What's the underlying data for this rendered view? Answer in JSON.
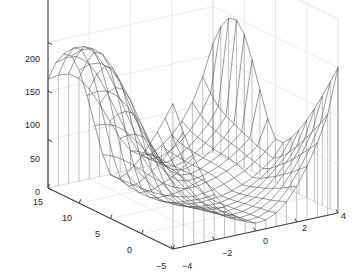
{
  "figure": {
    "type": "matlab-3d-mesh-figure",
    "background_color": "#ffffff",
    "axis_line_color": "#404040",
    "grid_color": "#e6e6e6",
    "mesh_line_color": "#4d4d4d",
    "skirt_line_color": "#808080",
    "tick_label_color": "#262626"
  },
  "axes": {
    "z": {
      "label": "",
      "min": 0,
      "max": 200,
      "ticks": [
        {
          "value": 0,
          "text": "0",
          "x": 40,
          "y": 188
        },
        {
          "value": 50,
          "text": "50",
          "x": 40,
          "y": 155
        },
        {
          "value": 100,
          "text": "100",
          "x": 40,
          "y": 121
        },
        {
          "value": 150,
          "text": "150",
          "x": 40,
          "y": 88
        },
        {
          "value": 200,
          "text": "200",
          "x": 40,
          "y": 55
        }
      ]
    },
    "y": {
      "label": "",
      "min": -5,
      "max": 15,
      "ticks": [
        {
          "value": 15,
          "text": "15",
          "x": 33,
          "y": 198
        },
        {
          "value": 10,
          "text": "10",
          "x": 62,
          "y": 214
        },
        {
          "value": 5,
          "text": "5",
          "x": 95,
          "y": 230
        },
        {
          "value": 0,
          "text": "0",
          "x": 127,
          "y": 246
        },
        {
          "value": -5,
          "text": "−5",
          "x": 156,
          "y": 262
        }
      ]
    },
    "x": {
      "label": "",
      "min": -4,
      "max": 4,
      "ticks": [
        {
          "value": -4,
          "text": "−4",
          "x": 182,
          "y": 262
        },
        {
          "value": -2,
          "text": "−2",
          "x": 222,
          "y": 249
        },
        {
          "value": 0,
          "text": "0",
          "x": 263,
          "y": 237
        },
        {
          "value": 2,
          "text": "2",
          "x": 302,
          "y": 224
        },
        {
          "value": 4,
          "text": "4",
          "x": 341,
          "y": 212
        }
      ]
    }
  },
  "chart_data": {
    "type": "surface",
    "title": "",
    "xlabel": "",
    "ylabel": "",
    "zlabel": "",
    "xlim": [
      -4,
      4
    ],
    "ylim": [
      -5,
      15
    ],
    "zlim": [
      0,
      200
    ],
    "xticks": [
      -4,
      -2,
      0,
      2,
      4
    ],
    "yticks": [
      -5,
      0,
      5,
      10,
      15
    ],
    "zticks": [
      0,
      50,
      100,
      150,
      200
    ],
    "grid": true,
    "legend": null,
    "view_azimuth": -37.5,
    "view_elevation": 30,
    "mesh_style": "wireframe-with-skirt",
    "nx": 17,
    "ny": 17,
    "x": [
      -4,
      -3.5,
      -3,
      -2.5,
      -2,
      -1.5,
      -1,
      -0.5,
      0,
      0.5,
      1,
      1.5,
      2,
      2.5,
      3,
      3.5,
      4
    ],
    "y": [
      -5,
      -3.75,
      -2.5,
      -1.25,
      0,
      1.25,
      2.5,
      3.75,
      5,
      6.25,
      7.5,
      8.75,
      10,
      11.25,
      12.5,
      13.75,
      15
    ],
    "z_rows": [
      [
        150,
        118,
        90,
        66,
        47,
        31,
        20,
        12,
        8,
        9,
        14,
        23,
        37,
        55,
        77,
        104,
        150
      ],
      [
        131,
        102,
        78,
        57,
        40,
        27,
        17,
        10,
        7,
        8,
        12,
        20,
        32,
        48,
        67,
        90,
        131
      ],
      [
        113,
        88,
        67,
        49,
        34,
        23,
        14,
        8,
        6,
        7,
        11,
        17,
        27,
        41,
        58,
        78,
        113
      ],
      [
        96,
        74,
        56,
        41,
        29,
        19,
        12,
        7,
        5,
        6,
        9,
        15,
        23,
        35,
        49,
        66,
        96
      ],
      [
        80,
        62,
        47,
        34,
        24,
        16,
        10,
        6,
        4,
        5,
        8,
        12,
        19,
        29,
        41,
        55,
        80
      ],
      [
        66,
        51,
        38,
        28,
        19,
        13,
        8,
        5,
        3,
        4,
        6,
        10,
        16,
        24,
        34,
        45,
        66
      ],
      [
        54,
        41,
        31,
        22,
        15,
        10,
        6,
        4,
        3,
        3,
        5,
        8,
        13,
        19,
        27,
        37,
        54
      ],
      [
        45,
        35,
        26,
        19,
        13,
        9,
        5,
        3,
        2,
        3,
        4,
        7,
        11,
        16,
        23,
        31,
        45
      ],
      [
        45,
        38,
        31,
        24,
        18,
        13,
        9,
        6,
        4,
        5,
        7,
        10,
        14,
        19,
        26,
        34,
        45
      ],
      [
        62,
        58,
        52,
        44,
        35,
        26,
        18,
        12,
        8,
        8,
        10,
        13,
        17,
        22,
        28,
        36,
        62
      ],
      [
        88,
        87,
        83,
        75,
        63,
        49,
        35,
        22,
        13,
        10,
        11,
        14,
        18,
        24,
        31,
        40,
        88
      ],
      [
        115,
        117,
        115,
        107,
        93,
        74,
        53,
        34,
        19,
        12,
        11,
        14,
        19,
        25,
        33,
        43,
        115
      ],
      [
        137,
        141,
        140,
        132,
        116,
        94,
        68,
        44,
        24,
        14,
        11,
        14,
        19,
        26,
        35,
        47,
        137
      ],
      [
        148,
        152,
        151,
        143,
        126,
        102,
        75,
        48,
        26,
        14,
        11,
        14,
        20,
        28,
        38,
        51,
        148
      ],
      [
        146,
        150,
        149,
        141,
        124,
        100,
        73,
        47,
        25,
        14,
        11,
        15,
        21,
        30,
        41,
        57,
        146
      ],
      [
        133,
        136,
        135,
        127,
        112,
        90,
        66,
        42,
        23,
        13,
        12,
        16,
        23,
        33,
        47,
        67,
        133
      ],
      [
        112,
        114,
        113,
        106,
        93,
        75,
        55,
        35,
        20,
        13,
        12,
        18,
        27,
        39,
        56,
        80,
        112
      ]
    ]
  }
}
